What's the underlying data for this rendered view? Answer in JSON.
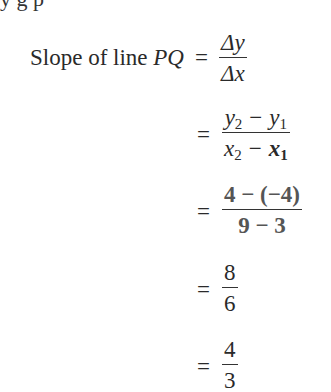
{
  "clipped_top_text": "y  g  p",
  "steps": [
    {
      "label_prefix": "Slope of line ",
      "label_var": "PQ",
      "equals": "=",
      "numerator": "Δy",
      "denominator": "Δx"
    },
    {
      "equals": "=",
      "numerator": {
        "a": "y",
        "a_sub": "2",
        "op": "−",
        "b": "y",
        "b_sub": "1"
      },
      "denominator": {
        "a": "x",
        "a_sub": "2",
        "op": "−",
        "b": "x",
        "b_sub": "1"
      }
    },
    {
      "equals": "=",
      "numerator": "4 − (−4)",
      "denominator": "9 − 3"
    },
    {
      "equals": "=",
      "numerator": "8",
      "denominator": "6"
    },
    {
      "equals": "=",
      "numerator": "4",
      "denominator": "3"
    }
  ]
}
